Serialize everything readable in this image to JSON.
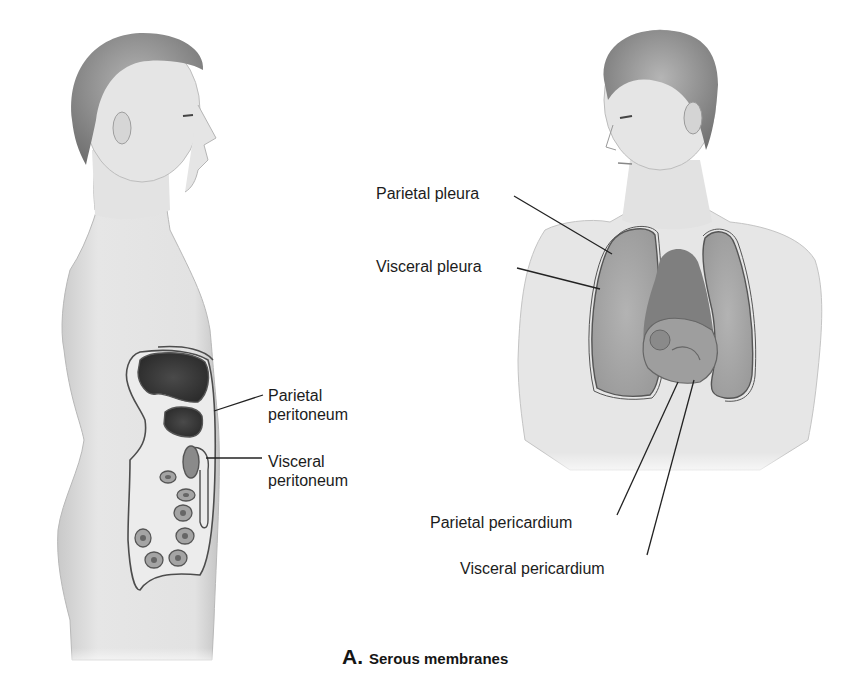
{
  "figure": {
    "caption": {
      "letter": "A.",
      "title": "Serous membranes"
    },
    "left_figure": {
      "description": "side-view-torso",
      "labels": [
        {
          "line1": "Parietal",
          "line2": "peritoneum"
        },
        {
          "line1": "Visceral",
          "line2": "peritoneum"
        }
      ]
    },
    "right_figure": {
      "description": "front-view-torso",
      "labels": [
        {
          "text": "Parietal pleura"
        },
        {
          "text": "Visceral pleura"
        },
        {
          "text": "Parietal pericardium"
        },
        {
          "text": "Visceral pericardium"
        }
      ]
    },
    "colors": {
      "skin": "#e4e4e4",
      "skin_shade": "#bdbdbd",
      "hair": "#8a8a8a",
      "organ_dark": "#3a3a3a",
      "organ_mid": "#8c8c8c",
      "lung": "#a9a9a9",
      "heart": "#7d7d7d",
      "leader_line": "#222222"
    }
  }
}
